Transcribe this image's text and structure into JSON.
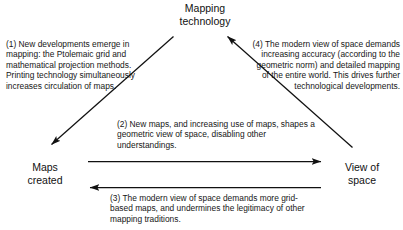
{
  "diagram": {
    "title_text": "Mapping technology causal diagram",
    "ink_color": "#111111",
    "background_color": "#ffffff",
    "nodes": [
      {
        "id": "mapping-technology",
        "label": "Mapping\ntechnology"
      },
      {
        "id": "maps-created",
        "label": "Maps\ncreated"
      },
      {
        "id": "view-of-space",
        "label": "View of\nspace"
      }
    ],
    "notes": [
      {
        "id": "note-1",
        "number": "(1)",
        "text": "(1) New developments emerge in mapping: the Ptolemaic grid and mathematical projection methods. Printing technology simultaneously increases circulation of maps."
      },
      {
        "id": "note-2",
        "number": "(2)",
        "text": "(2) New maps, and increasing use of maps, shapes a geometric view of space, disabling other understandings."
      },
      {
        "id": "note-3",
        "number": "(3)",
        "text": "(3) The modern view of space demands more grid-based maps, and undermines the legitimacy of other mapping traditions."
      },
      {
        "id": "note-4",
        "number": "(4)",
        "text": "(4) The modern view of space demands increasing accuracy (according to the geometric norm) and detailed mapping of the entire world. This drives further technological developments."
      }
    ],
    "arrows": [
      {
        "id": "arrow-mapping-to-maps",
        "from": "mapping-technology",
        "to": "maps-created",
        "direction": "down-left",
        "note": "note-1"
      },
      {
        "id": "arrow-maps-to-view",
        "from": "maps-created",
        "to": "view-of-space",
        "direction": "right",
        "note": "note-2"
      },
      {
        "id": "arrow-view-to-maps",
        "from": "view-of-space",
        "to": "maps-created",
        "direction": "left",
        "note": "note-3"
      },
      {
        "id": "arrow-view-to-mapping",
        "from": "view-of-space",
        "to": "mapping-technology",
        "direction": "up-left",
        "note": "note-4"
      }
    ]
  }
}
